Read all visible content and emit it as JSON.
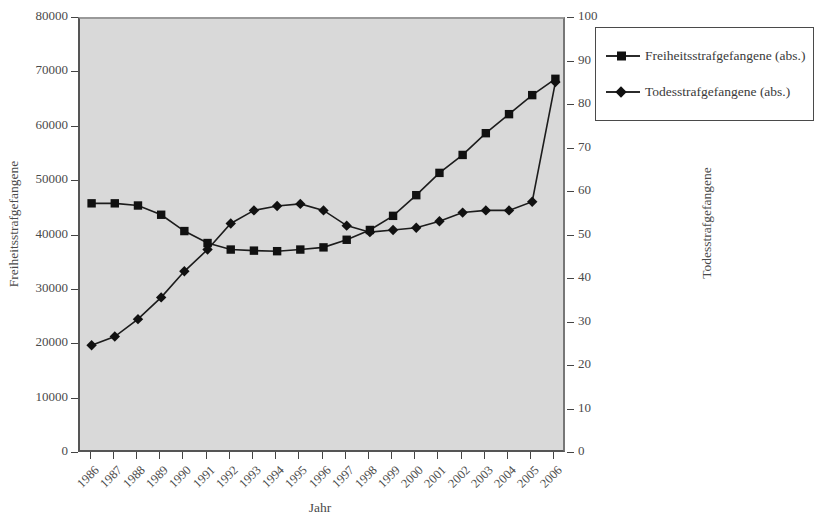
{
  "chart_data": {
    "type": "line",
    "title": "",
    "xlabel": "Jahr",
    "ylabel": "Freiheitsstrafgefangene",
    "ylabel_right": "Todesstrafgefangene",
    "grid": false,
    "legend_position": "right",
    "ylim": [
      0,
      80000
    ],
    "ylim_right": [
      0,
      100
    ],
    "yticks": [
      0,
      10000,
      20000,
      30000,
      40000,
      50000,
      60000,
      70000,
      80000
    ],
    "yticks_right": [
      0,
      10,
      20,
      30,
      40,
      50,
      60,
      70,
      80,
      90,
      100
    ],
    "categories": [
      "1986",
      "1987",
      "1988",
      "1989",
      "1990",
      "1991",
      "1992",
      "1993",
      "1994",
      "1995",
      "1996",
      "1997",
      "1998",
      "1999",
      "2000",
      "2001",
      "2002",
      "2003",
      "2004",
      "2005",
      "2006"
    ],
    "series": [
      {
        "name": "Freiheitsstrafgefangene (abs.)",
        "axis": "left",
        "marker": "square",
        "color": "#111111",
        "values": [
          46100,
          46100,
          45700,
          44000,
          41000,
          38800,
          37600,
          37400,
          37300,
          37600,
          38000,
          39400,
          41200,
          43800,
          47600,
          51700,
          55000,
          59000,
          62500,
          66000,
          69000
        ]
      },
      {
        "name": "Todesstrafgefangene (abs.)",
        "axis": "right",
        "marker": "diamond",
        "color": "#111111",
        "values": [
          25,
          27,
          31,
          36,
          42,
          47,
          53,
          56,
          57,
          57.5,
          56,
          52.5,
          51,
          51.5,
          52,
          53.5,
          55.5,
          56,
          56,
          58,
          85.5
        ]
      }
    ]
  },
  "legend": {
    "entries": [
      {
        "label": "Freiheitsstrafgefangene (abs.)",
        "marker": "square"
      },
      {
        "label": "Todesstrafgefangene (abs.)",
        "marker": "diamond"
      }
    ]
  }
}
